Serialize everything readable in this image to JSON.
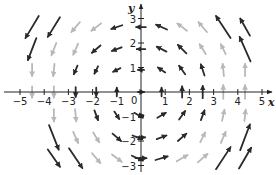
{
  "chart_data": {
    "type": "vector_field",
    "title": "",
    "xlabel": "x",
    "ylabel": "y",
    "xlim": [
      -5.4,
      5.4
    ],
    "ylim": [
      -3.4,
      3.4
    ],
    "x_ticks": [
      -5,
      -4,
      -3,
      -2,
      -1,
      1,
      2,
      3,
      4,
      5
    ],
    "y_ticks": [
      -3,
      -2,
      -1,
      1,
      2,
      3
    ],
    "origin_label": "0",
    "grid": false,
    "dark_color": "#2a2a2a",
    "light_color": "#b8b8b8",
    "vectors": [
      {
        "x": -4.5,
        "y": 2.65,
        "dx": -0.55,
        "dy": -0.9,
        "shade": "dark"
      },
      {
        "x": -3.6,
        "y": 2.65,
        "dx": -0.5,
        "dy": -0.8,
        "shade": "dark"
      },
      {
        "x": -2.7,
        "y": 2.65,
        "dx": -0.35,
        "dy": -0.4,
        "shade": "light"
      },
      {
        "x": -1.85,
        "y": 2.65,
        "dx": -0.4,
        "dy": -0.3,
        "shade": "light"
      },
      {
        "x": -1.0,
        "y": 2.65,
        "dx": -0.45,
        "dy": -0.15,
        "shade": "dark"
      },
      {
        "x": 0.0,
        "y": 2.65,
        "dx": -0.4,
        "dy": 0.0,
        "shade": "dark"
      },
      {
        "x": 0.85,
        "y": 2.65,
        "dx": -0.45,
        "dy": 0.2,
        "shade": "dark"
      },
      {
        "x": 1.7,
        "y": 2.65,
        "dx": -0.4,
        "dy": 0.3,
        "shade": "light"
      },
      {
        "x": 2.55,
        "y": 2.65,
        "dx": -0.35,
        "dy": 0.4,
        "shade": "light"
      },
      {
        "x": 3.4,
        "y": 2.65,
        "dx": -0.6,
        "dy": 0.9,
        "shade": "dark"
      },
      {
        "x": 4.3,
        "y": 2.65,
        "dx": -0.4,
        "dy": 0.7,
        "shade": "dark"
      },
      {
        "x": -4.5,
        "y": 1.75,
        "dx": -0.35,
        "dy": -0.9,
        "shade": "dark"
      },
      {
        "x": -3.6,
        "y": 1.75,
        "dx": -0.2,
        "dy": -0.5,
        "shade": "light"
      },
      {
        "x": -2.7,
        "y": 1.75,
        "dx": -0.2,
        "dy": -0.45,
        "shade": "light"
      },
      {
        "x": -1.85,
        "y": 1.75,
        "dx": -0.35,
        "dy": -0.3,
        "shade": "dark"
      },
      {
        "x": -1.0,
        "y": 1.75,
        "dx": -0.4,
        "dy": -0.15,
        "shade": "dark"
      },
      {
        "x": 0.0,
        "y": 1.75,
        "dx": -0.35,
        "dy": 0.0,
        "shade": "dark"
      },
      {
        "x": 0.85,
        "y": 1.75,
        "dx": -0.4,
        "dy": 0.2,
        "shade": "dark"
      },
      {
        "x": 1.7,
        "y": 1.75,
        "dx": -0.35,
        "dy": 0.35,
        "shade": "dark"
      },
      {
        "x": 2.55,
        "y": 1.75,
        "dx": -0.25,
        "dy": 0.4,
        "shade": "light"
      },
      {
        "x": 3.4,
        "y": 1.75,
        "dx": -0.2,
        "dy": 0.4,
        "shade": "light"
      },
      {
        "x": 4.3,
        "y": 1.75,
        "dx": -0.45,
        "dy": 1.0,
        "shade": "dark"
      },
      {
        "x": -4.5,
        "y": 0.9,
        "dx": 0.0,
        "dy": -0.5,
        "shade": "light"
      },
      {
        "x": -3.6,
        "y": 0.9,
        "dx": -0.05,
        "dy": -0.5,
        "shade": "light"
      },
      {
        "x": -2.7,
        "y": 0.9,
        "dx": -0.15,
        "dy": -0.35,
        "shade": "dark"
      },
      {
        "x": -1.85,
        "y": 0.9,
        "dx": -0.15,
        "dy": -0.3,
        "shade": "dark"
      },
      {
        "x": -1.0,
        "y": 0.9,
        "dx": -0.3,
        "dy": -0.15,
        "shade": "dark"
      },
      {
        "x": 0.0,
        "y": 0.9,
        "dx": -0.25,
        "dy": 0.0,
        "shade": "dark"
      },
      {
        "x": 0.85,
        "y": 0.9,
        "dx": -0.3,
        "dy": 0.2,
        "shade": "dark"
      },
      {
        "x": 1.7,
        "y": 0.9,
        "dx": -0.25,
        "dy": 0.35,
        "shade": "dark"
      },
      {
        "x": 2.55,
        "y": 0.9,
        "dx": -0.15,
        "dy": 0.45,
        "shade": "dark"
      },
      {
        "x": 3.4,
        "y": 0.9,
        "dx": -0.05,
        "dy": 0.5,
        "shade": "light"
      },
      {
        "x": 4.3,
        "y": 0.9,
        "dx": 0.0,
        "dy": 0.5,
        "shade": "light"
      },
      {
        "x": -4.5,
        "y": 0.0,
        "dx": 0.0,
        "dy": -0.45,
        "shade": "light"
      },
      {
        "x": -3.6,
        "y": 0.0,
        "dx": 0.0,
        "dy": -0.45,
        "shade": "light"
      },
      {
        "x": -2.7,
        "y": 0.0,
        "dx": 0.0,
        "dy": -0.4,
        "shade": "dark"
      },
      {
        "x": -1.85,
        "y": 0.0,
        "dx": 0.0,
        "dy": -0.35,
        "shade": "dark"
      },
      {
        "x": -1.0,
        "y": 0.0,
        "dx": 0.0,
        "dy": 0.35,
        "shade": "dark"
      },
      {
        "x": 0.0,
        "y": 0.0,
        "dx": 0.25,
        "dy": 0.0,
        "shade": "dark"
      },
      {
        "x": 0.85,
        "y": 0.0,
        "dx": 0.0,
        "dy": 0.35,
        "shade": "dark"
      },
      {
        "x": 1.7,
        "y": 0.0,
        "dx": 0.0,
        "dy": 0.45,
        "shade": "dark"
      },
      {
        "x": 2.55,
        "y": 0.0,
        "dx": 0.0,
        "dy": 0.5,
        "shade": "dark"
      },
      {
        "x": 3.4,
        "y": 0.0,
        "dx": 0.0,
        "dy": 0.55,
        "shade": "light"
      },
      {
        "x": 4.3,
        "y": 0.0,
        "dx": 0.0,
        "dy": 0.55,
        "shade": "light"
      },
      {
        "x": -3.6,
        "y": -0.95,
        "dx": 0.0,
        "dy": -0.5,
        "shade": "light"
      },
      {
        "x": -2.7,
        "y": -0.95,
        "dx": 0.05,
        "dy": -0.5,
        "shade": "light"
      },
      {
        "x": -1.85,
        "y": -0.95,
        "dx": 0.15,
        "dy": -0.4,
        "shade": "dark"
      },
      {
        "x": -1.0,
        "y": -0.95,
        "dx": 0.2,
        "dy": -0.3,
        "shade": "dark"
      },
      {
        "x": -0.1,
        "y": -0.95,
        "dx": 0.35,
        "dy": -0.2,
        "shade": "dark"
      },
      {
        "x": 0.0,
        "y": -0.95,
        "dx": 0.2,
        "dy": 0.0,
        "shade": "dark"
      },
      {
        "x": 0.85,
        "y": -0.95,
        "dx": 0.35,
        "dy": 0.2,
        "shade": "dark"
      },
      {
        "x": 1.7,
        "y": -0.95,
        "dx": 0.25,
        "dy": 0.35,
        "shade": "dark"
      },
      {
        "x": 2.55,
        "y": -0.95,
        "dx": 0.15,
        "dy": 0.4,
        "shade": "dark"
      },
      {
        "x": 3.4,
        "y": -0.95,
        "dx": 0.1,
        "dy": 0.45,
        "shade": "light"
      },
      {
        "x": 4.3,
        "y": -0.95,
        "dx": 0.05,
        "dy": 0.45,
        "shade": "light"
      },
      {
        "x": -3.6,
        "y": -1.85,
        "dx": 0.4,
        "dy": -1.0,
        "shade": "dark"
      },
      {
        "x": -2.7,
        "y": -1.85,
        "dx": 0.2,
        "dy": -0.45,
        "shade": "light"
      },
      {
        "x": -1.85,
        "y": -1.85,
        "dx": 0.25,
        "dy": -0.4,
        "shade": "light"
      },
      {
        "x": -1.0,
        "y": -1.85,
        "dx": 0.35,
        "dy": -0.3,
        "shade": "dark"
      },
      {
        "x": -0.15,
        "y": -1.85,
        "dx": 0.4,
        "dy": -0.15,
        "shade": "dark"
      },
      {
        "x": 0.0,
        "y": -1.85,
        "dx": 0.35,
        "dy": 0.0,
        "shade": "dark"
      },
      {
        "x": 0.85,
        "y": -1.85,
        "dx": 0.4,
        "dy": 0.15,
        "shade": "dark"
      },
      {
        "x": 1.7,
        "y": -1.85,
        "dx": 0.35,
        "dy": 0.3,
        "shade": "dark"
      },
      {
        "x": 2.55,
        "y": -1.85,
        "dx": 0.2,
        "dy": 0.4,
        "shade": "light"
      },
      {
        "x": 3.4,
        "y": -1.85,
        "dx": 0.2,
        "dy": 0.45,
        "shade": "light"
      },
      {
        "x": 4.3,
        "y": -1.85,
        "dx": 0.4,
        "dy": 1.05,
        "shade": "dark"
      },
      {
        "x": -3.6,
        "y": -2.7,
        "dx": 0.5,
        "dy": -0.7,
        "shade": "dark"
      },
      {
        "x": -2.7,
        "y": -2.7,
        "dx": 0.55,
        "dy": -0.8,
        "shade": "dark"
      },
      {
        "x": -1.85,
        "y": -2.7,
        "dx": 0.35,
        "dy": -0.4,
        "shade": "light"
      },
      {
        "x": -1.0,
        "y": -2.7,
        "dx": 0.4,
        "dy": -0.3,
        "shade": "light"
      },
      {
        "x": -0.15,
        "y": -2.7,
        "dx": 0.45,
        "dy": -0.2,
        "shade": "dark"
      },
      {
        "x": 0.0,
        "y": -2.7,
        "dx": 0.45,
        "dy": 0.0,
        "shade": "dark"
      },
      {
        "x": 0.85,
        "y": -2.7,
        "dx": 0.5,
        "dy": 0.15,
        "shade": "dark"
      },
      {
        "x": 1.7,
        "y": -2.7,
        "dx": 0.45,
        "dy": 0.25,
        "shade": "light"
      },
      {
        "x": 2.55,
        "y": -2.7,
        "dx": 0.4,
        "dy": 0.35,
        "shade": "light"
      },
      {
        "x": 3.4,
        "y": -2.7,
        "dx": 0.6,
        "dy": 0.9,
        "shade": "dark"
      },
      {
        "x": 4.3,
        "y": -2.7,
        "dx": 0.5,
        "dy": 0.85,
        "shade": "dark"
      }
    ]
  }
}
